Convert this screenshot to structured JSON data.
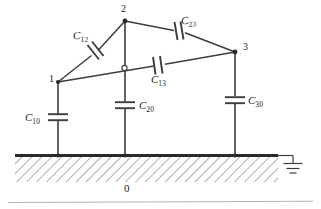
{
  "figure": {
    "kind": "capacitance-network-diagram",
    "colors": {
      "line": "#3c3c41",
      "ground_bar": "#2a2a2e",
      "hatch": "#8c8c92",
      "text": "#1a1a1a",
      "background": "#ffffff",
      "bottom_rule": "#b5b5ba"
    }
  },
  "nodes": [
    {
      "id": "1",
      "label": "1",
      "x": 58,
      "y": 82,
      "label_x": 49,
      "label_y": 79
    },
    {
      "id": "2",
      "label": "2",
      "x": 125,
      "y": 21,
      "label_x": 122,
      "label_y": 6
    },
    {
      "id": "3",
      "label": "3",
      "x": 235,
      "y": 52,
      "label_x": 242,
      "label_y": 44
    },
    {
      "id": "0",
      "label": "0",
      "x": 127,
      "y": 190,
      "label_x": 123,
      "label_y": 184
    }
  ],
  "capacitors": [
    {
      "id": "C12",
      "base": "C",
      "sub": "12",
      "label_x": 74,
      "label_y": 31,
      "orientation": "diagonal"
    },
    {
      "id": "C23",
      "base": "C",
      "sub": "23",
      "label_x": 182,
      "label_y": 16,
      "orientation": "diagonal"
    },
    {
      "id": "C13",
      "base": "C",
      "sub": "13",
      "label_x": 152,
      "label_y": 74,
      "orientation": "diagonal"
    },
    {
      "id": "C10",
      "base": "C",
      "sub": "10",
      "label_x": 26,
      "label_y": 115,
      "orientation": "vertical"
    },
    {
      "id": "C20",
      "base": "C",
      "sub": "20",
      "label_x": 138,
      "label_y": 101,
      "orientation": "vertical"
    },
    {
      "id": "C30",
      "base": "C",
      "sub": "30",
      "label_x": 246,
      "label_y": 95,
      "orientation": "vertical"
    }
  ],
  "ground": {
    "bar_label": "0",
    "symbol_name": "earth-ground-symbol",
    "bar_x_start": 15,
    "bar_x_end": 278,
    "bar_y": 155,
    "hatch_depth": 27
  }
}
